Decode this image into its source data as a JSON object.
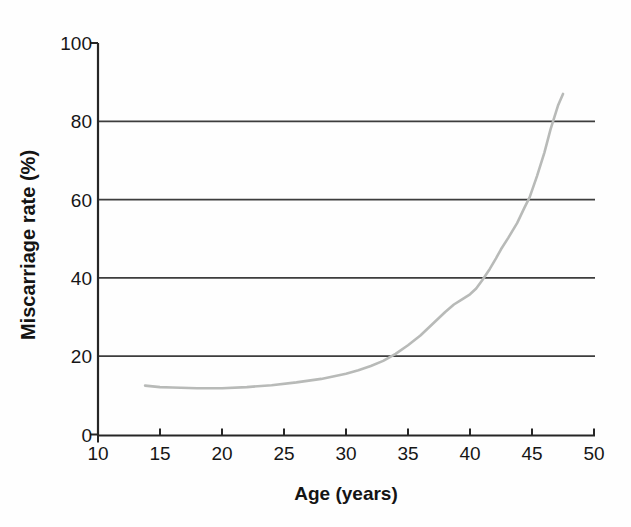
{
  "chart_data": {
    "type": "line",
    "title": "",
    "xlabel": "Age (years)",
    "ylabel": "Miscarriage rate (%)",
    "xlim": [
      10,
      50
    ],
    "ylim": [
      0,
      100
    ],
    "xticks": [
      10,
      15,
      20,
      25,
      30,
      35,
      40,
      45,
      50
    ],
    "yticks": [
      0,
      20,
      40,
      60,
      80,
      100
    ],
    "gridlines_y": [
      20,
      40,
      60,
      80
    ],
    "grid": "horizontal-only",
    "legend_position": "none",
    "series": [
      {
        "name": "Miscarriage rate by maternal age",
        "color": "#b8bab8",
        "points": [
          [
            13.8,
            12.5
          ],
          [
            15,
            12.1
          ],
          [
            16,
            12.0
          ],
          [
            18,
            11.8
          ],
          [
            20,
            11.8
          ],
          [
            22,
            12.1
          ],
          [
            24,
            12.6
          ],
          [
            26,
            13.3
          ],
          [
            28,
            14.2
          ],
          [
            30,
            15.5
          ],
          [
            31,
            16.4
          ],
          [
            32,
            17.5
          ],
          [
            33,
            18.8
          ],
          [
            34,
            20.6
          ],
          [
            35,
            22.8
          ],
          [
            36,
            25.3
          ],
          [
            37,
            28.3
          ],
          [
            38,
            31.3
          ],
          [
            38.7,
            33.2
          ],
          [
            39.3,
            34.4
          ],
          [
            40,
            35.8
          ],
          [
            40.5,
            37.3
          ],
          [
            41,
            39.5
          ],
          [
            41.6,
            42.3
          ],
          [
            42.1,
            45.0
          ],
          [
            42.5,
            47.3
          ],
          [
            43.1,
            50.3
          ],
          [
            43.8,
            54.0
          ],
          [
            44.4,
            58.0
          ],
          [
            44.8,
            60.5
          ],
          [
            45.4,
            66.0
          ],
          [
            46.0,
            72.0
          ],
          [
            46.5,
            78.0
          ],
          [
            46.8,
            81.0
          ],
          [
            47.1,
            84.0
          ],
          [
            47.5,
            87.0
          ]
        ]
      }
    ]
  },
  "colors": {
    "background": "#fefefe",
    "axis": "#262626",
    "grid": "#3d3d3d",
    "tick": "#262626",
    "curve": "#b8bab8",
    "text": "#141414"
  }
}
